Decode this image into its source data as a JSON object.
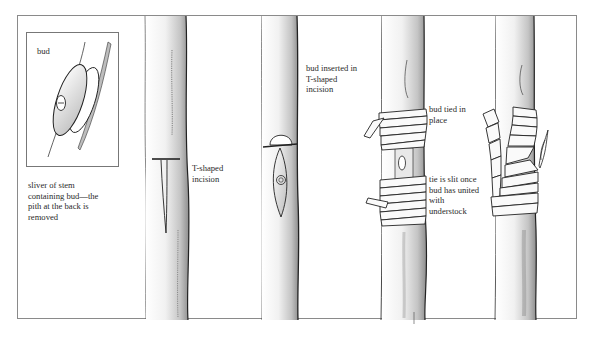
{
  "diagram": {
    "panels": [
      {
        "id": "bud-sliver",
        "inset_label": "bud",
        "caption": "sliver of stem\ncontaining bud—the\npith at the back is\nremoved"
      },
      {
        "id": "t-incision",
        "caption": "T-shaped\nincision"
      },
      {
        "id": "bud-inserted",
        "caption": "bud inserted in\nT-shaped\nincision"
      },
      {
        "id": "bud-tied",
        "caption_top": "bud tied in\nplace",
        "caption_bottom": "tie is slit once\nbud has united\nwith\nunderstock"
      },
      {
        "id": "tie-slit",
        "caption": ""
      }
    ],
    "colors": {
      "ink": "#2a2a2a",
      "frame": "#8a8a8a",
      "shade": "#9a9a9a",
      "background": "#ffffff"
    }
  }
}
